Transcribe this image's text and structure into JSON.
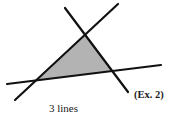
{
  "diagram": {
    "caption": "3 lines",
    "example_label": "(Ex. 2)",
    "colors": {
      "line": "#111111",
      "fill": "#b3b3b3",
      "background": "#ffffff"
    },
    "lines": [
      {
        "name": "line-a",
        "x1": 15,
        "y1": 100,
        "x2": 118,
        "y2": 4
      },
      {
        "name": "line-b",
        "x1": 65,
        "y1": 8,
        "x2": 128,
        "y2": 92
      },
      {
        "name": "line-c",
        "x1": 7,
        "y1": 84,
        "x2": 161,
        "y2": 65
      }
    ],
    "triangle": {
      "points": "86,35 37,81 113,71"
    }
  }
}
